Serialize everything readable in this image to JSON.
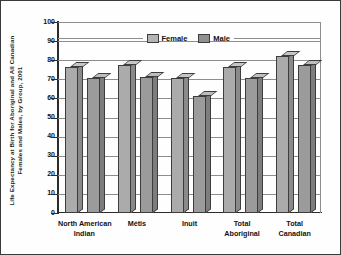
{
  "chart_data": {
    "type": "bar",
    "title": "",
    "ylabel": "Life Expectancy at Birth for Aboriginal and All Canadian Females and Males, by Group, 2001",
    "ylabel_lines": [
      "Life Expectancy at Birth for Aboriginal and All Canadian",
      "Females and Males, by Group, 2001"
    ],
    "xlabel": "",
    "ylim": [
      0,
      100
    ],
    "yticks": [
      0,
      10,
      20,
      30,
      40,
      50,
      60,
      70,
      80,
      90,
      100
    ],
    "ytick_labels": [
      "0",
      "10",
      "20",
      "30",
      "40",
      "50",
      "60",
      "70",
      "80",
      "90",
      "100"
    ],
    "grid": true,
    "legend_position": "top-center",
    "style": "3d-bar-grayscale",
    "categories": [
      "North American Indian",
      "Métis",
      "Inuit",
      "Total Aboriginal",
      "Total Canadian"
    ],
    "category_lines": [
      [
        "North American",
        "Indian"
      ],
      [
        "Métis"
      ],
      [
        "Inuit"
      ],
      [
        "Total",
        "Aboriginal"
      ],
      [
        "Total",
        "Canadian"
      ]
    ],
    "series": [
      {
        "name": "Female",
        "color": "#ababab",
        "values": [
          76.5,
          77.5,
          70.5,
          76.5,
          82.0
        ]
      },
      {
        "name": "Male",
        "color": "#9b9b9b",
        "values": [
          70.5,
          71.0,
          61.5,
          70.5,
          77.5
        ]
      }
    ]
  },
  "legend": {
    "items": [
      {
        "label": "Female",
        "swatch": "#b4b4b4"
      },
      {
        "label": "Male",
        "swatch": "#909090"
      }
    ]
  },
  "colors": {
    "axis": "#2b2b2b",
    "grid": "#8d8d8d",
    "frame": "#3a3a3a",
    "text": "#111111",
    "background": "#fefefe"
  }
}
